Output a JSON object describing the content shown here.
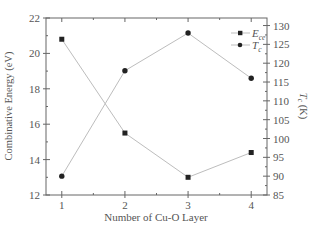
{
  "chart_data": {
    "type": "line",
    "title": "",
    "xlabel": "Number of Cu-O Layer",
    "ylabel": "Combinative Energy (eV)",
    "y2label": "T_c (K)",
    "x": [
      1,
      2,
      3,
      4
    ],
    "x_ticks": [
      "1",
      "2",
      "3",
      "4"
    ],
    "ylim": [
      12,
      22
    ],
    "y_ticks": [
      12,
      14,
      16,
      18,
      20,
      22
    ],
    "y2lim": [
      85,
      132
    ],
    "y2_ticks": [
      85,
      90,
      95,
      100,
      105,
      110,
      115,
      120,
      125,
      130
    ],
    "grid": false,
    "legend_position": "upper right",
    "series": [
      {
        "name": "E_ce",
        "legend_main": "E",
        "legend_sub": "ce",
        "axis": "left",
        "marker": "square",
        "values": [
          20.8,
          15.5,
          13.0,
          14.4
        ]
      },
      {
        "name": "T_c",
        "legend_main": "T",
        "legend_sub": "c",
        "axis": "right",
        "marker": "circle",
        "values": [
          90,
          118,
          128,
          116
        ]
      }
    ],
    "colors": {
      "axis": "#666666",
      "line": "#bdbdbd",
      "marker": "#222222",
      "text": "#555555"
    }
  }
}
